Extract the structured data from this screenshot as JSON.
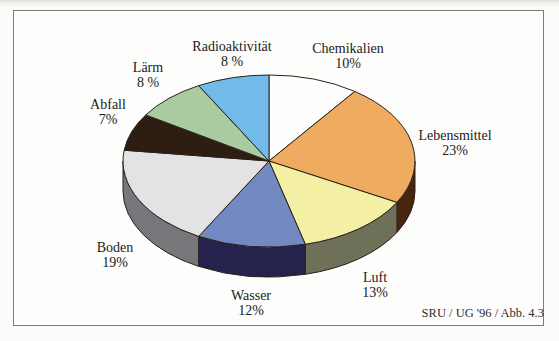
{
  "figure": {
    "caption": "SRU / UG '96 / Abb. 4.3"
  },
  "chart_data": {
    "type": "pie",
    "style": "3d-extruded",
    "title": "",
    "legend": false,
    "start_angle_deg": 0,
    "direction": "clockwise",
    "unit": "%",
    "outline_color": "#2b211a",
    "annotation": "SRU / UG '96 / Abb. 4.3",
    "slices": [
      {
        "label": "Chemikalien",
        "value": 10,
        "pct_label": "10%",
        "color": "#fefefe",
        "side_color": "#8f8f86"
      },
      {
        "label": "Lebensmittel",
        "value": 23,
        "pct_label": "23%",
        "color": "#efac61",
        "side_color": "#47250f"
      },
      {
        "label": "Luft",
        "value": 13,
        "pct_label": "13%",
        "color": "#f3efa4",
        "side_color": "#6e7158"
      },
      {
        "label": "Wasser",
        "value": 12,
        "pct_label": "12%",
        "color": "#7289c1",
        "side_color": "#25234d"
      },
      {
        "label": "Boden",
        "value": 19,
        "pct_label": "19%",
        "color": "#e3e3e6",
        "side_color": "#77777b"
      },
      {
        "label": "Abfall",
        "value": 7,
        "pct_label": "7%",
        "color": "#2e1d11",
        "side_color": "#1a100a"
      },
      {
        "label": "Lärm",
        "value": 8,
        "pct_label": "8 %",
        "color": "#a8cca0",
        "side_color": "#5d7a5b"
      },
      {
        "label": "Radioaktivität",
        "value": 8,
        "pct_label": "8 %",
        "color": "#72bbe8",
        "side_color": "#3d7ba0"
      }
    ]
  }
}
